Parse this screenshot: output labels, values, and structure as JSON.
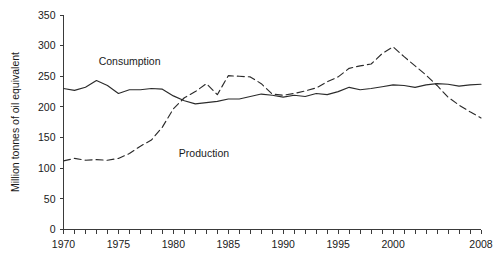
{
  "chart_data": {
    "type": "line",
    "title": "",
    "xlabel": "",
    "ylabel": "Million tonnes of oil equivalent",
    "xlim": [
      1970,
      2008
    ],
    "ylim": [
      0,
      350
    ],
    "grid": false,
    "legend_position": "inline-annotations",
    "y_ticks": [
      0,
      50,
      100,
      150,
      200,
      250,
      300,
      350
    ],
    "y_tick_labels": [
      "0",
      "50",
      "100",
      "150",
      "200",
      "250",
      "300",
      "350"
    ],
    "x_ticks": [
      1970,
      1971,
      1972,
      1973,
      1974,
      1975,
      1976,
      1977,
      1978,
      1979,
      1980,
      1981,
      1982,
      1983,
      1984,
      1985,
      1986,
      1987,
      1988,
      1989,
      1990,
      1991,
      1992,
      1993,
      1994,
      1995,
      1996,
      1997,
      1998,
      1999,
      2000,
      2001,
      2002,
      2003,
      2004,
      2005,
      2006,
      2007,
      2008
    ],
    "x_tick_labels": [
      {
        "value": 1970,
        "label": "1970"
      },
      {
        "value": 1975,
        "label": "1975"
      },
      {
        "value": 1980,
        "label": "1980"
      },
      {
        "value": 1985,
        "label": "1985"
      },
      {
        "value": 1990,
        "label": "1990"
      },
      {
        "value": 1995,
        "label": "1995"
      },
      {
        "value": 2000,
        "label": "2000"
      },
      {
        "value": 2008,
        "label": "2008"
      }
    ],
    "x": [
      1970,
      1971,
      1972,
      1973,
      1974,
      1975,
      1976,
      1977,
      1978,
      1979,
      1980,
      1981,
      1982,
      1983,
      1984,
      1985,
      1986,
      1987,
      1988,
      1989,
      1990,
      1991,
      1992,
      1993,
      1994,
      1995,
      1996,
      1997,
      1998,
      1999,
      2000,
      2001,
      2002,
      2003,
      2004,
      2005,
      2006,
      2007,
      2008
    ],
    "series": [
      {
        "name": "Consumption",
        "style": "solid",
        "color": "#2b2b2b",
        "label_x": 1973.2,
        "label_y": 268,
        "values": [
          230,
          227,
          232,
          243,
          235,
          222,
          228,
          228,
          230,
          229,
          218,
          210,
          205,
          207,
          209,
          213,
          213,
          217,
          221,
          219,
          216,
          219,
          217,
          222,
          220,
          225,
          232,
          228,
          230,
          233,
          236,
          235,
          232,
          236,
          238,
          237,
          234,
          236,
          237
        ]
      },
      {
        "name": "Production",
        "style": "dashed",
        "color": "#2b2b2b",
        "label_x": 1980.5,
        "label_y": 119,
        "values": [
          112,
          116,
          113,
          114,
          113,
          116,
          124,
          136,
          146,
          167,
          197,
          215,
          225,
          238,
          220,
          251,
          250,
          249,
          238,
          221,
          219,
          222,
          226,
          231,
          241,
          249,
          263,
          267,
          270,
          287,
          298,
          282,
          267,
          252,
          235,
          216,
          203,
          192,
          182
        ]
      }
    ]
  }
}
